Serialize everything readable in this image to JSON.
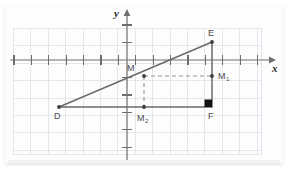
{
  "figure": {
    "kind": "coordinate-geometry-diagram",
    "background_color": "#ffffff",
    "card_color": "#fdfdfd",
    "grid_color": "#dfe3ea",
    "grid_minor_color": "#e9ecf1",
    "axis_color": "#6b6b6b",
    "line_color": "#6a6a6a",
    "dash_color": "#8d8d8d",
    "label_color": "#4a4a4a",
    "axis_label_color": "#2b2b2b",
    "marker_color": "#111111"
  },
  "axes": {
    "x_label": "x",
    "y_label": "y",
    "x_tick_count": 14,
    "y_tick_count": 7,
    "grid_cell_px": 17.4,
    "show_grid": true,
    "show_ticks": true,
    "show_arrows": true
  },
  "points": [
    {
      "id": "D",
      "label": "D",
      "x": 59,
      "y": 107,
      "label_dx": -4,
      "label_dy": 6,
      "dot": true,
      "label_sub": ""
    },
    {
      "id": "E",
      "label": "E",
      "x": 212,
      "y": 42,
      "label_dx": -2,
      "label_dy": -14,
      "dot": true,
      "label_sub": ""
    },
    {
      "id": "F",
      "label": "F",
      "x": 212,
      "y": 107,
      "label_dx": -2,
      "label_dy": 7,
      "dot": false,
      "label_sub": ""
    },
    {
      "id": "M",
      "label": "M",
      "x": 144,
      "y": 76,
      "label_dx": -15,
      "label_dy": -11,
      "dot": true,
      "label_sub": ""
    },
    {
      "id": "M1",
      "label": "M",
      "x": 212,
      "y": 76,
      "label_dx": 5,
      "label_dy": -4,
      "dot": true,
      "label_sub": "1"
    },
    {
      "id": "M2",
      "label": "M",
      "x": 144,
      "y": 107,
      "label_dx": -5,
      "label_dy": 8,
      "dot": true,
      "label_sub": "2"
    }
  ],
  "segments": [
    {
      "name": "segment-DE",
      "from": "D",
      "to": "E",
      "style": "solid"
    },
    {
      "name": "segment-DF",
      "from": "D",
      "to": "F",
      "style": "solid"
    },
    {
      "name": "segment-EF",
      "from": "E",
      "to": "F",
      "style": "solid"
    },
    {
      "name": "segment-M-M1",
      "from": "M",
      "to": "M1",
      "style": "dashed"
    },
    {
      "name": "segment-M-M2",
      "from": "M",
      "to": "M2",
      "style": "dashed"
    }
  ],
  "right_angle": {
    "at": "F",
    "size": 7,
    "filled": true
  }
}
